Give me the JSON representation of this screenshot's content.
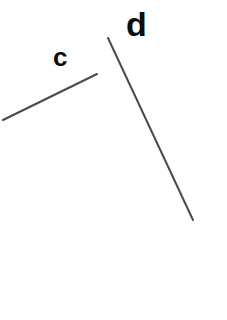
{
  "figure": {
    "background_color": "#ffffff",
    "width": 227,
    "height": 320,
    "stroke_color": "#4a4a4a",
    "label_color": "#0d0d0d",
    "labels": [
      {
        "id": "c",
        "text": "c",
        "x": 53,
        "y": 44
      },
      {
        "id": "d",
        "text": "d",
        "x": 126,
        "y": 7
      }
    ],
    "segments": [
      {
        "id": "c",
        "name": "line-segment-c",
        "x1": 3,
        "y1": 120,
        "x2": 97,
        "y2": 74,
        "stroke_width": 2,
        "color": "#4a4a4a"
      },
      {
        "id": "d",
        "name": "line-segment-d",
        "x1": 108,
        "y1": 38,
        "x2": 193,
        "y2": 220,
        "stroke_width": 2,
        "color": "#4a4a4a"
      }
    ]
  },
  "chart_data": {
    "type": "scatter",
    "title": "",
    "xlabel": "",
    "ylabel": "",
    "grid": false,
    "legend": "none",
    "xlim": [
      0,
      227
    ],
    "ylim": [
      320,
      0
    ],
    "series": [
      {
        "name": "c",
        "label": "c",
        "kind": "line-segment",
        "x": [
          3,
          97
        ],
        "y": [
          120,
          74
        ],
        "color": "#4a4a4a"
      },
      {
        "name": "d",
        "label": "d",
        "kind": "line-segment",
        "x": [
          108,
          193
        ],
        "y": [
          38,
          220
        ],
        "color": "#4a4a4a"
      }
    ],
    "annotations": [
      {
        "text": "c",
        "x": 63,
        "y": 58
      },
      {
        "text": "d",
        "x": 138,
        "y": 28
      }
    ]
  }
}
